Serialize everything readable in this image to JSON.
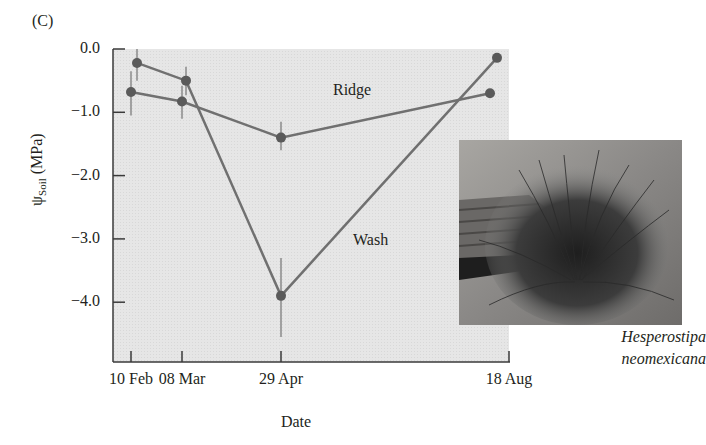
{
  "panel_label": "(C)",
  "chart_data": {
    "type": "line",
    "title": "",
    "xlabel": "Date",
    "ylabel": "ψSoil (MPa)",
    "ylabel_main": "ψ",
    "ylabel_sub": "Soil",
    "ylabel_unit": " (MPa)",
    "ylim": [
      -4.9,
      0.0
    ],
    "yticks": [
      "0.0",
      "-1.0",
      "-2.0",
      "-3.0",
      "-4.0"
    ],
    "ytick_values": [
      0.0,
      -1.0,
      -2.0,
      -3.0,
      -4.0
    ],
    "categories": [
      "10 Feb",
      "08 Mar",
      "29 Apr",
      "18 Aug"
    ],
    "grid": false,
    "legend": "inline labels",
    "series": [
      {
        "name": "Ridge",
        "values": [
          -0.68,
          -0.83,
          -1.4,
          -0.7
        ],
        "error_low": [
          -1.05,
          -1.1,
          -1.6,
          -0.7
        ],
        "error_high": [
          -0.35,
          -0.58,
          -1.15,
          -0.7
        ]
      },
      {
        "name": "Wash",
        "values": [
          -0.22,
          -0.5,
          -3.9,
          -0.14
        ],
        "error_low": [
          -0.5,
          -0.73,
          -4.55,
          -0.14
        ],
        "error_high": [
          0.0,
          -0.28,
          -3.3,
          -0.14
        ]
      }
    ]
  },
  "annotations": {
    "ridge_label": "Ridge",
    "wash_label": "Wash"
  },
  "photo": {
    "subject": "grass-tussock-photo",
    "caption_line1": "Hesperostipa",
    "caption_line2": "neomexicana"
  },
  "colors": {
    "plot_bg": "#e4e4e4",
    "series_line": "#707070",
    "marker": "#5a5a5a",
    "axis": "#3a3a3a"
  }
}
